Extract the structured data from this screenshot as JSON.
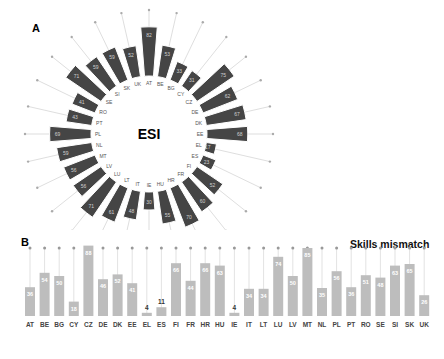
{
  "panels": {
    "a_label": "A",
    "b_label": "B"
  },
  "chart_data": [
    {
      "type": "radial-bar",
      "title": "ESI",
      "note": "Values in this panel are approximate estimates from bar lengths; the printed labels are not legible at this resolution.",
      "categories": [
        "AT",
        "BE",
        "BG",
        "CY",
        "CZ",
        "DE",
        "DK",
        "EE",
        "EL",
        "ES",
        "FI",
        "FR",
        "HR",
        "HU",
        "IE",
        "IT",
        "LT",
        "LU",
        "LV",
        "MT",
        "NL",
        "PL",
        "PT",
        "RO",
        "SE",
        "SI",
        "SK",
        "UK"
      ],
      "values": [
        82,
        53,
        33,
        31,
        75,
        62,
        67,
        68,
        17,
        23,
        52,
        60,
        70,
        55,
        30,
        48,
        61,
        71,
        56,
        56,
        59,
        69,
        43,
        41,
        71,
        59,
        59,
        52
      ],
      "bar_color": "#454545",
      "spoke_color": "#c8c8c8",
      "ylim": [
        0,
        100
      ]
    },
    {
      "type": "bar",
      "title": "Skills mismatch",
      "categories": [
        "AT",
        "BE",
        "BG",
        "CY",
        "CZ",
        "DE",
        "DK",
        "EE",
        "EL",
        "ES",
        "FI",
        "FR",
        "HR",
        "HU",
        "IE",
        "IT",
        "LT",
        "LU",
        "LV",
        "MT",
        "NL",
        "PL",
        "PT",
        "RO",
        "SE",
        "SI",
        "SK",
        "UK"
      ],
      "values": [
        36,
        54,
        50,
        18,
        88,
        46,
        52,
        41,
        4,
        11,
        66,
        44,
        66,
        63,
        4,
        34,
        34,
        74,
        50,
        85,
        35,
        56,
        36,
        51,
        48,
        63,
        65,
        26
      ],
      "bar_color": "#bdbdbd",
      "stem_color": "#cfcfcf",
      "ylim": [
        0,
        100
      ]
    }
  ]
}
